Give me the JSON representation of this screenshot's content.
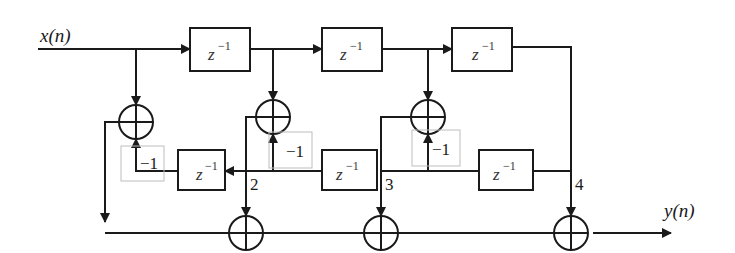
{
  "diagram": {
    "input_label": "x(n)",
    "output_label": "y(n)",
    "delay_label_base": "z",
    "delay_label_exp": "−1",
    "gain_label": "−1",
    "node_labels": [
      "2",
      "3",
      "4"
    ],
    "top_delays": [
      {
        "id": "d1"
      },
      {
        "id": "d2"
      },
      {
        "id": "d3"
      }
    ],
    "bottom_delays": [
      {
        "id": "b1"
      },
      {
        "id": "b2"
      },
      {
        "id": "b3"
      }
    ],
    "colors": {
      "line": "#1a1a1a",
      "gain_box": "#bdbdbd",
      "background": "#ffffff"
    }
  }
}
